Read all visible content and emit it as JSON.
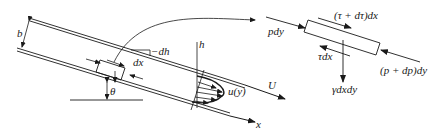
{
  "diagram": {
    "colors": {
      "ink": "#1a1a1a",
      "background": "#ffffff"
    },
    "labels": {
      "channel_width": "b",
      "height_drop": "−dh",
      "element_length": "dx",
      "incline_angle": "θ",
      "height_axis": "h",
      "velocity_profile": "u(y)",
      "free_stream_velocity": "U",
      "x_axis": "x"
    },
    "free_body": {
      "left_pressure": "pdy",
      "top_shear": "(τ + dτ)dx",
      "bottom_shear": "τdx",
      "right_pressure": "(p + dp)dy",
      "weight": "γdxdy"
    }
  }
}
